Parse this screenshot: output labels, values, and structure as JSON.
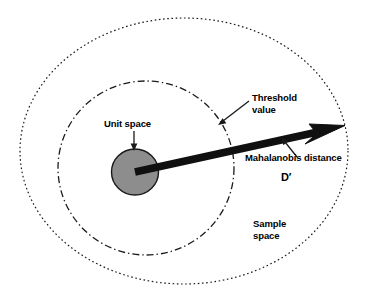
{
  "diagram": {
    "labels": {
      "threshold_value": "Threshold\nvalue",
      "unit_space": "Unit space",
      "mahalanobis_distance": "Mahalanobis distance",
      "d_symbol": "D′",
      "sample_space": "Sample\nspace"
    },
    "colors": {
      "stroke": "#1a1a1a",
      "unit_space_fill": "#8d8d8d",
      "background": "#ffffff"
    },
    "shapes": {
      "sample_space_ellipse": {
        "name": "outer dotted ellipse",
        "cx": 184,
        "cy": 151,
        "rx": 164,
        "ry": 133,
        "line_style": "dotted"
      },
      "threshold_ellipse": {
        "name": "inner dash-dot ellipse",
        "cx": 146,
        "cy": 168,
        "rx": 88,
        "ry": 87,
        "line_style": "dash-dot"
      },
      "unit_space_circle": {
        "name": "filled gray unit space circle",
        "cx": 135,
        "cy": 172,
        "rx": 23,
        "ry": 23,
        "fill": "#8d8d8d"
      },
      "distance_arrow": {
        "name": "thick Mahalanobis distance arrow",
        "x1": 135,
        "y1": 172,
        "x2": 344,
        "y2": 126
      }
    }
  }
}
